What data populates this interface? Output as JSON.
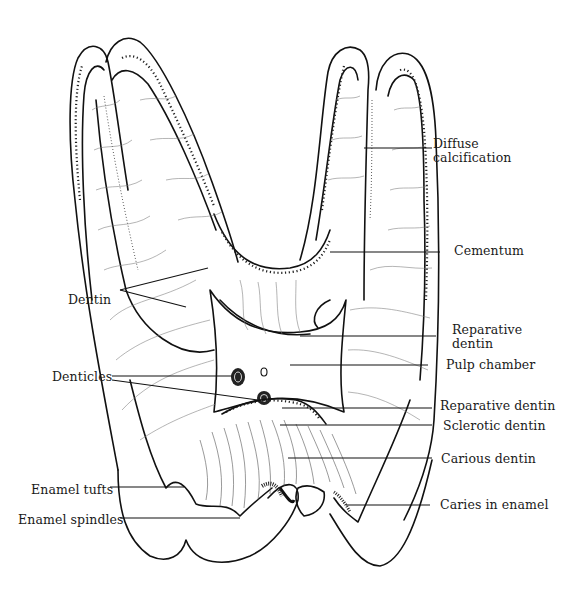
{
  "figure": {
    "background": "#ffffff",
    "ink_color": "#111111"
  },
  "labels": {
    "diffuse_calcification": {
      "line1": "Diffuse",
      "line2": "calcification"
    },
    "cementum": "Cementum",
    "dentin": "Dentin",
    "reparative_dentin_upper": {
      "line1": "Reparative",
      "line2": "dentin"
    },
    "pulp_chamber": "Pulp chamber",
    "denticles": "Denticles",
    "reparative_dentin_lower": "Reparative dentin",
    "sclerotic_dentin": "Sclerotic dentin",
    "carious_dentin": "Carious dentin",
    "enamel_tufts": "Enamel tufts",
    "enamel_spindles": "Enamel spindles",
    "caries_in_enamel": "Caries in enamel"
  }
}
